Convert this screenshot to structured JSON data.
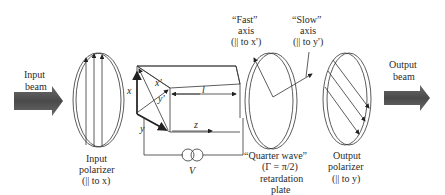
{
  "input_beam": {
    "line1": "Input",
    "line2": "beam"
  },
  "output_beam": {
    "line1": "Output",
    "line2": "beam"
  },
  "input_polarizer": {
    "line1": "Input",
    "line2": "polarizer",
    "line3": "(|| to x)"
  },
  "output_polarizer": {
    "line1": "Output",
    "line2": "polarizer",
    "line3": "(|| to y)"
  },
  "crystal": {
    "x_axis": "x",
    "y_axis": "y",
    "x_prime": "x'",
    "y_prime": "y'",
    "z_axis": "z",
    "length": "l",
    "voltage": "V"
  },
  "fast_axis": {
    "line1": "“Fast”",
    "line2": "axis",
    "line3": "(|| to x')"
  },
  "slow_axis": {
    "line1": "“Slow”",
    "line2": "axis",
    "line3": "(|| to y')"
  },
  "retardation_plate": {
    "line1": "“Quarter wave”",
    "line2": "(Γ = π/2)",
    "line3": "retardation",
    "line4": "plate"
  },
  "colors": {
    "beam": "#555555",
    "lines": "#333333",
    "background": "#ffffff"
  }
}
